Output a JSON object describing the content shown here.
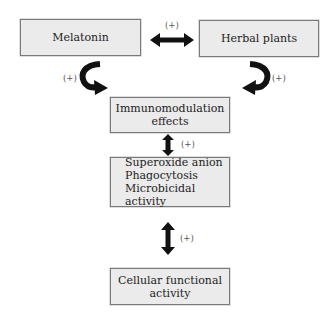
{
  "diagram": {
    "nodes": {
      "melatonin": {
        "label": "Melatonin"
      },
      "herbal_plants": {
        "label": "Herbal plants"
      },
      "immunomodulation": {
        "lines": [
          "Immunomodulation",
          "effects"
        ]
      },
      "mechanisms": {
        "lines": [
          "Superoxide anion",
          "Phagocytosis",
          "Microbicidal activity"
        ]
      },
      "cellular": {
        "lines": [
          "Cellular functional",
          "activity"
        ]
      }
    },
    "edges": {
      "melatonin_herbal": {
        "label": "(+)",
        "type": "bidirectional"
      },
      "melatonin_immuno": {
        "label": "(+)",
        "type": "curved"
      },
      "herbal_immuno": {
        "label": "(+)",
        "type": "curved"
      },
      "immuno_mechanisms": {
        "label": "(+)",
        "type": "bidirectional"
      },
      "mechanisms_cellular": {
        "label": "(+)",
        "type": "bidirectional"
      }
    },
    "colors": {
      "box_fill": "#ebebeb",
      "box_border": "#7a7a7a",
      "arrow": "#111111"
    }
  }
}
